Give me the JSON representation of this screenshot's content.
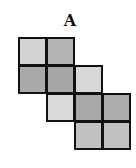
{
  "figure": {
    "label": "A",
    "grid": {
      "origin_x": 18,
      "origin_y": 37,
      "cell_size": 29,
      "cells": [
        {
          "col": 0,
          "row": 0,
          "color": "#d4d4d4"
        },
        {
          "col": 1,
          "row": 0,
          "color": "#b4b4b4"
        },
        {
          "col": 0,
          "row": 1,
          "color": "#a9a9a9"
        },
        {
          "col": 1,
          "row": 1,
          "color": "#a6a6a6"
        },
        {
          "col": 2,
          "row": 1,
          "color": "#d8d8d8"
        },
        {
          "col": 1,
          "row": 2,
          "color": "#dadada"
        },
        {
          "col": 2,
          "row": 2,
          "color": "#a8a8a8"
        },
        {
          "col": 3,
          "row": 2,
          "color": "#adadad"
        },
        {
          "col": 2,
          "row": 3,
          "color": "#c2c2c2"
        },
        {
          "col": 3,
          "row": 3,
          "color": "#c2c2c2"
        }
      ]
    }
  }
}
